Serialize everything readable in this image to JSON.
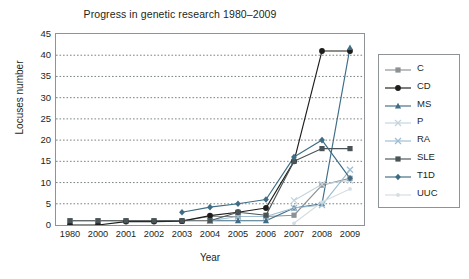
{
  "chart_data": {
    "type": "line",
    "title": "Progress in genetic research 1980–2009",
    "xlabel": "Year",
    "ylabel": "Locuses number",
    "categories": [
      "1980",
      "2000",
      "2001",
      "2002",
      "2003",
      "2004",
      "2005",
      "2006",
      "2007",
      "2008",
      "2009"
    ],
    "ylim": [
      0,
      45
    ],
    "yticks": [
      0,
      5,
      10,
      15,
      20,
      25,
      30,
      35,
      40,
      45
    ],
    "grid": "horizontal-dotted",
    "legend_position": "right-outside",
    "series": [
      {
        "name": "C",
        "color": "#8c9193",
        "marker": "square",
        "values": [
          1,
          1,
          1,
          1,
          1,
          2,
          2,
          2,
          2.3,
          9.4,
          11
        ]
      },
      {
        "name": "CD",
        "color": "#1d1d1b",
        "marker": "circle",
        "values": [
          0,
          0,
          0.8,
          0.8,
          0.9,
          2.2,
          3,
          4,
          15,
          41,
          41
        ]
      },
      {
        "name": "MS",
        "color": "#3f6d86",
        "marker": "triangle",
        "values": [
          null,
          null,
          null,
          null,
          null,
          1,
          1,
          1,
          4,
          5,
          41.8
        ]
      },
      {
        "name": "P",
        "color": "#c3d4df",
        "marker": "x",
        "values": [
          null,
          null,
          null,
          null,
          null,
          null,
          null,
          null,
          5.8,
          9.6,
          10.5
        ]
      },
      {
        "name": "RA",
        "color": "#9ebdd2",
        "marker": "x",
        "values": [
          null,
          null,
          null,
          null,
          null,
          1,
          2,
          2,
          4,
          4.7,
          13
        ]
      },
      {
        "name": "SLE",
        "color": "#4a5456",
        "marker": "square",
        "values": [
          1,
          1,
          1,
          1,
          1,
          1,
          3,
          2.3,
          15,
          18,
          18
        ]
      },
      {
        "name": "T1D",
        "color": "#3d6c84",
        "marker": "diamond",
        "values": [
          null,
          null,
          null,
          null,
          3,
          4.2,
          5,
          6,
          16,
          20,
          11
        ]
      },
      {
        "name": "UUC",
        "color": "#d5dde1",
        "marker": "dot",
        "values": [
          null,
          null,
          null,
          null,
          null,
          null,
          null,
          null,
          0.4,
          5.4,
          8.5
        ]
      }
    ]
  },
  "axes": {
    "y_title": "Locuses number",
    "x_title": "Year",
    "y_tick_labels": [
      "45",
      "40",
      "35",
      "30",
      "25",
      "20",
      "15",
      "10",
      "5",
      "0"
    ],
    "x_tick_labels": [
      "1980",
      "2000",
      "2001",
      "2002",
      "2003",
      "2004",
      "2005",
      "2006",
      "2007",
      "2008",
      "2009"
    ]
  },
  "legend": {
    "items": [
      {
        "label": "C"
      },
      {
        "label": "CD"
      },
      {
        "label": "MS"
      },
      {
        "label": "P"
      },
      {
        "label": "RA"
      },
      {
        "label": "SLE"
      },
      {
        "label": "T1D"
      },
      {
        "label": "UUC"
      }
    ]
  },
  "colors": {
    "axis": "#8e9496",
    "grid": "#5b6365",
    "text": "#231f20",
    "background": "#ffffff"
  }
}
